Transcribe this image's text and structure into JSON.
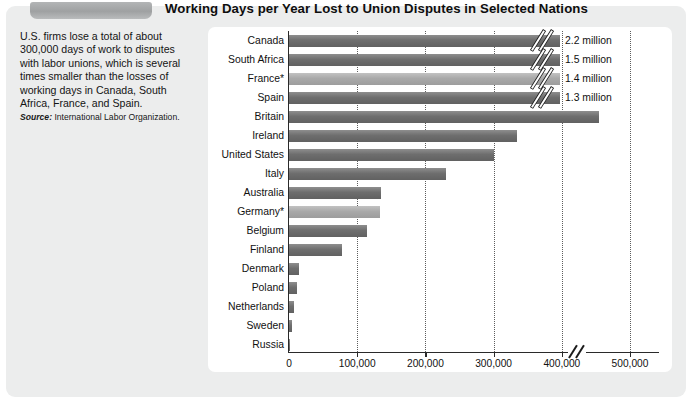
{
  "title": "Working Days per Year Lost to Union Disputes in Selected Nations",
  "sidebar": {
    "lede": "U.S. firms lose a total of about 300,000 days of work to disputes with labor unions, which is several times smaller than the losses of working days in Canada, South Africa, France, and Spain.",
    "source_label": "Source:",
    "source_text": "International Labor Organization."
  },
  "chart_data": {
    "type": "bar",
    "orientation": "horizontal",
    "title": "Working Days per Year Lost to Union Disputes in Selected Nations",
    "xlabel": "",
    "ylabel": "",
    "xlim": [
      0,
      570000
    ],
    "axis_break_after": 500000,
    "grid": "vertical-dotted",
    "legend": "none",
    "tick_labels": [
      "0",
      "100,000",
      "200,000",
      "300,000",
      "400,000",
      "500,000"
    ],
    "tick_values": [
      0,
      100000,
      200000,
      300000,
      400000,
      500000
    ],
    "categories": [
      "Canada",
      "South Africa",
      "France*",
      "Spain",
      "Britain",
      "Ireland",
      "United States",
      "Italy",
      "Australia",
      "Germany*",
      "Belgium",
      "Finland",
      "Denmark",
      "Poland",
      "Netherlands",
      "Sweden",
      "Russia"
    ],
    "values": [
      2200000,
      1500000,
      1400000,
      1300000,
      455000,
      335000,
      300000,
      230000,
      135000,
      134000,
      115000,
      78000,
      15000,
      11000,
      8000,
      4000,
      1000
    ],
    "value_labels": [
      "2.2 million",
      "1.5 million",
      "1.4 million",
      "1.3 million",
      "",
      "",
      "",
      "",
      "",
      "",
      "",
      "",
      "",
      "",
      "",
      "",
      ""
    ],
    "truncated": [
      true,
      true,
      true,
      true,
      false,
      false,
      false,
      false,
      false,
      false,
      false,
      false,
      false,
      false,
      false,
      false,
      false
    ],
    "bar_shades": [
      "dark",
      "dark",
      "light",
      "dark",
      "dark",
      "dark",
      "dark",
      "dark",
      "dark",
      "light",
      "dark",
      "dark",
      "dark",
      "dark",
      "dark",
      "dark",
      "dark"
    ],
    "colors": {
      "bar_dark": "#6e6e6e",
      "bar_light": "#a9a9a9",
      "axis": "#2a2a2a",
      "grid": "#5d5d5d",
      "panel": "#ffffff",
      "page": "#eceded"
    }
  }
}
